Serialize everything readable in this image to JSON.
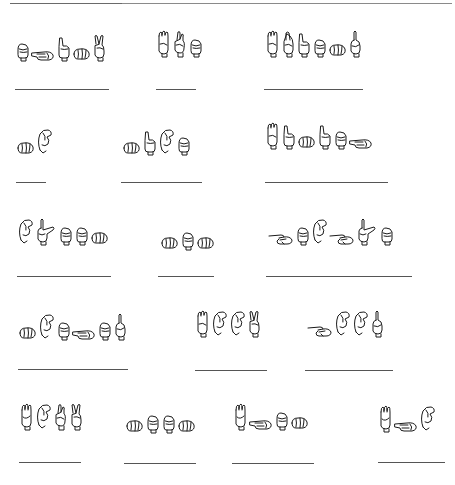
{
  "worksheet": {
    "title": "Fingerspelling worksheet",
    "instructions": "",
    "top_rules": [
      {
        "x": 10,
        "w": 112
      },
      {
        "x": 122,
        "w": 330
      }
    ],
    "ink_color": "#1a1a1a",
    "line_color": "#555555",
    "words": [
      {
        "id": 1,
        "row": 1,
        "signs": [
          "fist",
          "flat-side",
          "index-hook",
          "fist-side",
          "v"
        ],
        "signs_x": 15,
        "signs_y": 34,
        "line": {
          "x": 15,
          "y": 89,
          "w": 94
        }
      },
      {
        "id": 2,
        "row": 1,
        "signs": [
          "b",
          "k",
          "fist"
        ],
        "signs_x": 156,
        "signs_y": 30,
        "line": {
          "x": 156,
          "y": 89,
          "w": 40
        }
      },
      {
        "id": 3,
        "row": 1,
        "signs": [
          "b",
          "r",
          "index-hook",
          "fist",
          "fist-side",
          "d"
        ],
        "signs_x": 265,
        "signs_y": 30,
        "line": {
          "x": 264,
          "y": 89,
          "w": 99
        }
      },
      {
        "id": 4,
        "row": 2,
        "signs": [
          "fist-side",
          "c-open"
        ],
        "signs_x": 16,
        "signs_y": 128,
        "line": {
          "x": 16,
          "y": 182,
          "w": 30
        }
      },
      {
        "id": 5,
        "row": 2,
        "signs": [
          "fist-side",
          "index-hook",
          "c-open",
          "fist"
        ],
        "signs_x": 122,
        "signs_y": 128,
        "line": {
          "x": 121,
          "y": 182,
          "w": 81
        }
      },
      {
        "id": 6,
        "row": 2,
        "signs": [
          "b",
          "index-hook",
          "fist-side",
          "index-hook",
          "fist",
          "flat-side"
        ],
        "signs_x": 265,
        "signs_y": 122,
        "line": {
          "x": 265,
          "y": 182,
          "w": 123
        }
      },
      {
        "id": 7,
        "row": 3,
        "signs": [
          "c-open",
          "l",
          "fist",
          "fist",
          "fist-side"
        ],
        "signs_x": 17,
        "signs_y": 218,
        "line": {
          "x": 17,
          "y": 276,
          "w": 94
        }
      },
      {
        "id": 8,
        "row": 3,
        "signs": [
          "fist-side",
          "fist",
          "fist-side"
        ],
        "signs_x": 160,
        "signs_y": 229,
        "line": {
          "x": 158,
          "y": 276,
          "w": 56
        }
      },
      {
        "id": 9,
        "row": 3,
        "signs": [
          "g",
          "fist",
          "c-open",
          "g",
          "l",
          "fist"
        ],
        "signs_x": 268,
        "signs_y": 218,
        "line": {
          "x": 266,
          "y": 276,
          "w": 146
        }
      },
      {
        "id": 10,
        "row": 4,
        "signs": [
          "fist-side",
          "c-open",
          "fist",
          "flat-side",
          "fist",
          "d"
        ],
        "signs_x": 18,
        "signs_y": 313,
        "line": {
          "x": 18,
          "y": 369,
          "w": 110
        }
      },
      {
        "id": 11,
        "row": 4,
        "signs": [
          "b",
          "c-open",
          "c-open",
          "v"
        ],
        "signs_x": 195,
        "signs_y": 310,
        "line": {
          "x": 195,
          "y": 370,
          "w": 72
        }
      },
      {
        "id": 12,
        "row": 4,
        "signs": [
          "g",
          "c-open",
          "c-open",
          "d"
        ],
        "signs_x": 307,
        "signs_y": 310,
        "line": {
          "x": 305,
          "y": 370,
          "w": 88
        }
      },
      {
        "id": 13,
        "row": 5,
        "signs": [
          "w",
          "c-open",
          "k",
          "v"
        ],
        "signs_x": 19,
        "signs_y": 403,
        "line": {
          "x": 19,
          "y": 462,
          "w": 62
        }
      },
      {
        "id": 14,
        "row": 5,
        "signs": [
          "fist-side",
          "fist",
          "fist",
          "fist-side"
        ],
        "signs_x": 125,
        "signs_y": 412,
        "line": {
          "x": 124,
          "y": 463,
          "w": 72
        }
      },
      {
        "id": 15,
        "row": 5,
        "signs": [
          "w",
          "flat-side",
          "fist",
          "fist-side"
        ],
        "signs_x": 233,
        "signs_y": 403,
        "line": {
          "x": 232,
          "y": 463,
          "w": 82
        }
      },
      {
        "id": 16,
        "row": 5,
        "signs": [
          "w",
          "flat-side",
          "c-open"
        ],
        "signs_x": 378,
        "signs_y": 405,
        "line": {
          "x": 378,
          "y": 462,
          "w": 67
        }
      }
    ]
  }
}
